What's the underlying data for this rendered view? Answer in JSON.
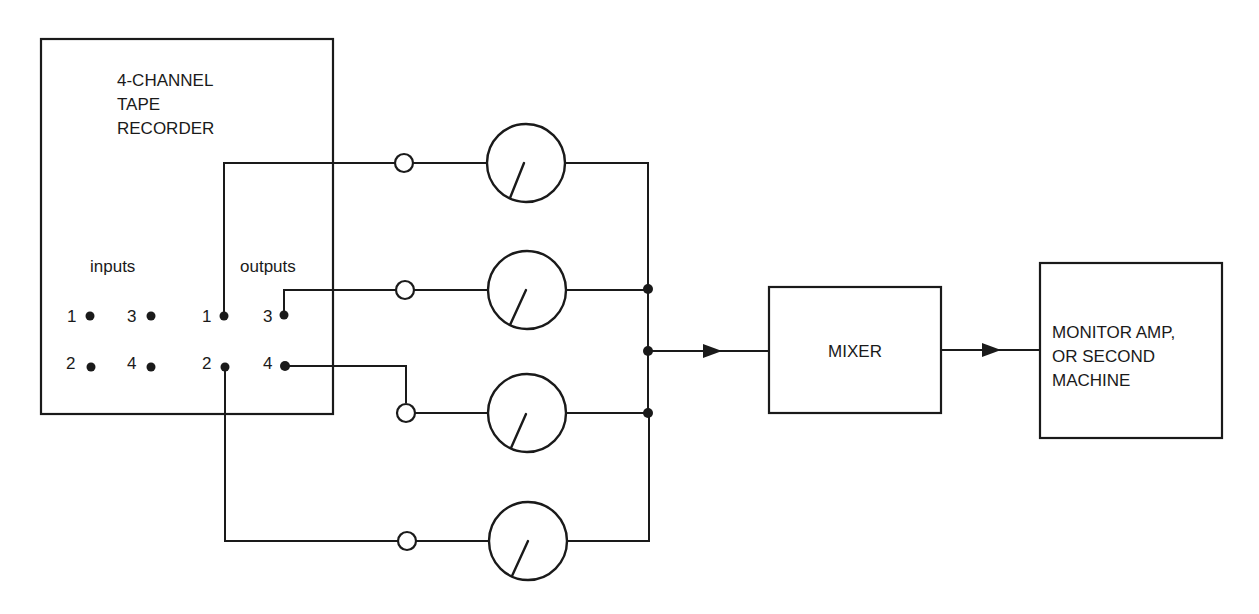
{
  "recorder": {
    "title_lines": [
      "4-CHANNEL",
      "TAPE",
      "RECORDER"
    ],
    "inputs_label": "inputs",
    "outputs_label": "outputs",
    "input_pins": [
      "1",
      "3",
      "2",
      "4"
    ],
    "output_pins": [
      "1",
      "3",
      "2",
      "4"
    ]
  },
  "mixer": {
    "label": "MIXER"
  },
  "monitor": {
    "lines": [
      "MONITOR AMP,",
      "OR SECOND",
      "MACHINE"
    ]
  },
  "channels": [
    {
      "output": "1",
      "fader": "fader-1"
    },
    {
      "output": "3",
      "fader": "fader-2"
    },
    {
      "output": "4",
      "fader": "fader-3"
    },
    {
      "output": "2",
      "fader": "fader-4"
    }
  ],
  "colors": {
    "ink": "#1a1a1a",
    "background": "#ffffff"
  }
}
